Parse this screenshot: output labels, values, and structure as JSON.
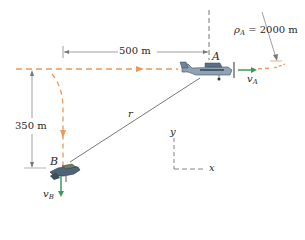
{
  "diagram": {
    "dimensions": {
      "horizontal": "500 m",
      "vertical": "350 m"
    },
    "radius": {
      "symbol": "ρ",
      "subscript": "A",
      "equals": " = 2000 m"
    },
    "points": {
      "A": "A",
      "B": "B"
    },
    "velocities": {
      "vA_symbol": "v",
      "vA_sub": "A",
      "vB_symbol": "v",
      "vB_sub": "B"
    },
    "position_vector": "r",
    "axes": {
      "x": "x",
      "y": "y"
    },
    "colors": {
      "path": "#e89a5c",
      "velocity": "#3a9a5a",
      "line": "#555555",
      "aircraft": "#7a8ea3"
    }
  }
}
